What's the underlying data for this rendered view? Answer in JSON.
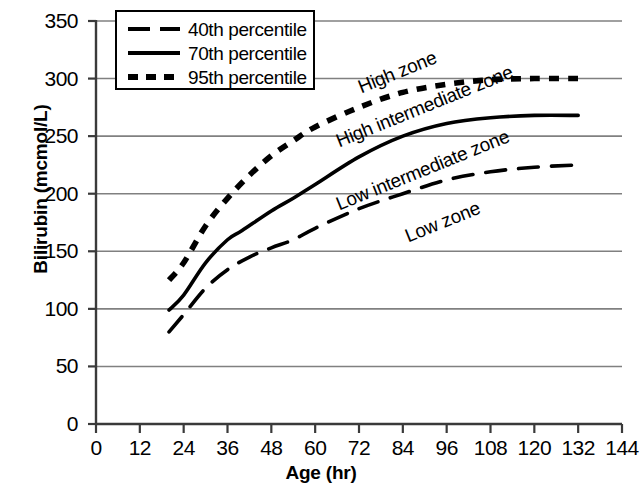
{
  "chart_data": {
    "type": "line",
    "title": "",
    "xlabel": "Age (hr)",
    "ylabel": "Bilirubin (mcmol/L)",
    "xlim": [
      0,
      144
    ],
    "ylim": [
      0,
      350
    ],
    "xticks": [
      0,
      12,
      24,
      36,
      48,
      60,
      72,
      84,
      96,
      108,
      120,
      132,
      144
    ],
    "yticks": [
      0,
      50,
      100,
      150,
      200,
      250,
      300,
      350
    ],
    "grid": "horizontal",
    "legend_position": "top-left",
    "series": [
      {
        "name": "40th percentile",
        "style": "dashed",
        "color": "#000000",
        "x": [
          20,
          24,
          30,
          36,
          42,
          48,
          54,
          60,
          72,
          84,
          96,
          108,
          120,
          132
        ],
        "values": [
          80,
          95,
          118,
          134,
          145,
          153,
          160,
          170,
          187,
          200,
          212,
          219,
          223,
          225
        ]
      },
      {
        "name": "70th percentile",
        "style": "solid",
        "color": "#000000",
        "x": [
          20,
          24,
          30,
          36,
          40,
          48,
          54,
          60,
          72,
          84,
          96,
          108,
          120,
          132
        ],
        "values": [
          99,
          112,
          140,
          160,
          168,
          185,
          196,
          208,
          232,
          250,
          261,
          266,
          268,
          268
        ]
      },
      {
        "name": "95th percentile",
        "style": "dotted",
        "color": "#000000",
        "x": [
          20,
          24,
          30,
          36,
          42,
          48,
          54,
          60,
          72,
          84,
          96,
          108,
          120,
          132
        ],
        "values": [
          125,
          140,
          172,
          196,
          216,
          233,
          246,
          258,
          275,
          288,
          295,
          299,
          300,
          300
        ]
      }
    ],
    "annotations": [
      {
        "text": "High zone",
        "x": 72,
        "y": 292,
        "rotation": -22
      },
      {
        "text": "High intermediate zone",
        "x": 66,
        "y": 245,
        "rotation": -22
      },
      {
        "text": "Low intermediate zone",
        "x": 66,
        "y": 190,
        "rotation": -22
      },
      {
        "text": "Low zone",
        "x": 85,
        "y": 162,
        "rotation": -22
      }
    ]
  },
  "axes": {
    "y_title": "Bilirubin (mcmol/L)",
    "x_title": "Age (hr)",
    "y_tick_labels": [
      "350",
      "300",
      "250",
      "200",
      "150",
      "100",
      "50",
      "0"
    ],
    "x_tick_labels": [
      "0",
      "12",
      "24",
      "36",
      "48",
      "60",
      "72",
      "84",
      "96",
      "108",
      "120",
      "132",
      "144"
    ]
  },
  "legend": {
    "items": [
      {
        "label": "40th percentile",
        "style": "dashed"
      },
      {
        "label": "70th percentile",
        "style": "solid"
      },
      {
        "label": "95th percentile",
        "style": "dotted"
      }
    ]
  },
  "zones": [
    {
      "label": "High zone"
    },
    {
      "label": "High intermediate zone"
    },
    {
      "label": "Low intermediate zone"
    },
    {
      "label": "Low zone"
    }
  ],
  "colors": {
    "line": "#000000",
    "grid": "#808080",
    "axis": "#3a3a3a",
    "background": "#ffffff"
  }
}
